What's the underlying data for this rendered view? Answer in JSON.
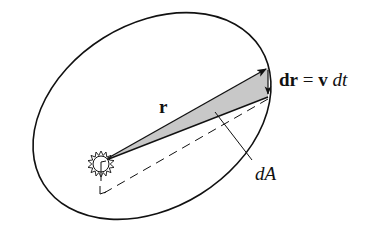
{
  "diagram": {
    "type": "orbital-area-sweep",
    "labels": {
      "position_vector": "r",
      "displacement_bold": "dr",
      "equals": "=",
      "velocity_bold": "v",
      "dt": "dt",
      "area": "dA"
    },
    "colors": {
      "stroke": "#111111",
      "shaded_area": "#c8c8c8",
      "background": "#ffffff"
    },
    "elements": [
      "elliptical-orbit",
      "sun",
      "position-vector-r",
      "displacement-vector-dr",
      "swept-area-dA",
      "dashed-line",
      "leader-line"
    ]
  }
}
